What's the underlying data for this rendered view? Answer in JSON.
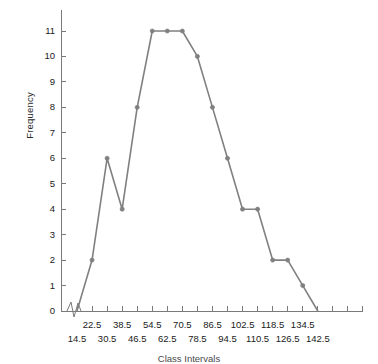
{
  "axis": {
    "y_title": "Frequency",
    "x_title": "Class Intervals",
    "y_ticks": [
      "0",
      "1",
      "2",
      "3",
      "4",
      "5",
      "6",
      "7",
      "8",
      "9",
      "10",
      "11"
    ],
    "x_ticks_row_top": [
      "22.5",
      "38.5",
      "54.5",
      "70.5",
      "86.5",
      "102.5",
      "118.5",
      "134.5"
    ],
    "x_ticks_row_bottom": [
      "14.5",
      "30.5",
      "46.5",
      "62.5",
      "78.5",
      "94.5",
      "110.5",
      "126.5",
      "142.5"
    ],
    "axis_break": "zigzag-break"
  },
  "style": {
    "line_color": "#808080",
    "marker_color": "#808080",
    "axis_color": "#7a7a7a",
    "text_color": "#1a1a1a",
    "background": "#ffffff"
  },
  "chart_data": {
    "type": "line",
    "title": "",
    "subtitle": "",
    "xlabel": "Class Intervals",
    "ylabel": "Frequency",
    "grid": false,
    "legend": false,
    "legend_position": "none",
    "xlim": [
      14.5,
      142.5
    ],
    "ylim": [
      0,
      11
    ],
    "x_tick_step": 8,
    "categories": [
      "14.5",
      "22.5",
      "30.5",
      "38.5",
      "46.5",
      "54.5",
      "62.5",
      "70.5",
      "78.5",
      "86.5",
      "94.5",
      "102.5",
      "110.5",
      "118.5",
      "126.5",
      "134.5",
      "142.5"
    ],
    "x": [
      14.5,
      22.5,
      30.5,
      38.5,
      46.5,
      54.5,
      62.5,
      70.5,
      78.5,
      86.5,
      94.5,
      102.5,
      110.5,
      118.5,
      126.5,
      134.5,
      142.5
    ],
    "values": [
      0,
      2,
      6,
      4,
      8,
      11,
      11,
      11,
      10,
      8,
      6,
      4,
      4,
      2,
      2,
      1,
      0
    ],
    "series": [
      {
        "name": "Frequency",
        "values": [
          0,
          2,
          6,
          4,
          8,
          11,
          11,
          11,
          10,
          8,
          6,
          4,
          4,
          2,
          2,
          1,
          0
        ]
      }
    ],
    "annotations": [
      "x-axis break between origin and first class midpoint"
    ]
  }
}
